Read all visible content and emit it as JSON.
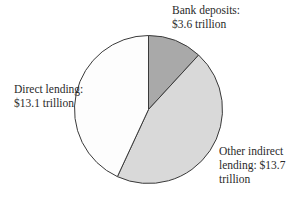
{
  "chart_data": {
    "type": "pie",
    "title": "",
    "unit": "trillion dollars",
    "categories": [
      "Bank deposits",
      "Other indirect lending",
      "Direct lending"
    ],
    "values": [
      3.6,
      13.7,
      13.1
    ],
    "colors": [
      "#a9a9a9",
      "#d9d9d9",
      "#fdfdfd"
    ],
    "start_angle_deg": -90,
    "direction": "clockwise",
    "legend": "none",
    "annotations": [
      {
        "category": "Bank deposits",
        "lines": [
          "Bank deposits:",
          "$3.6 trillion"
        ]
      },
      {
        "category": "Direct lending",
        "lines": [
          "Direct lending:",
          "$13.1 trillion"
        ]
      },
      {
        "category": "Other indirect lending",
        "lines": [
          "Other indirect",
          "lending: $13.7",
          "trillion"
        ]
      }
    ]
  },
  "labels": {
    "bank_deposits": {
      "line1": "Bank deposits:",
      "line2": "$3.6 trillion"
    },
    "direct_lending": {
      "line1": "Direct lending:",
      "line2": "$13.1 trillion"
    },
    "other_indirect": {
      "line1": "Other indirect",
      "line2": "lending: $13.7",
      "line3": "trillion"
    }
  }
}
